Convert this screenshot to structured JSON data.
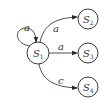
{
  "diagram": {
    "type": "state-machine",
    "nodes": [
      {
        "id": "S1",
        "base": "S",
        "sub": "1"
      },
      {
        "id": "S2",
        "base": "S",
        "sub": "2"
      },
      {
        "id": "S3",
        "base": "S",
        "sub": "3"
      },
      {
        "id": "S4",
        "base": "S",
        "sub": "4"
      }
    ],
    "edges": [
      {
        "from": "S1",
        "to": "S1",
        "label": "a"
      },
      {
        "from": "S1",
        "to": "S2",
        "label": "a"
      },
      {
        "from": "S1",
        "to": "S3",
        "label": "a"
      },
      {
        "from": "S1",
        "to": "S4",
        "label": "c"
      }
    ],
    "colors": {
      "stroke": "#3a3a3a",
      "text": "#333333",
      "background": "#ffffff"
    }
  }
}
